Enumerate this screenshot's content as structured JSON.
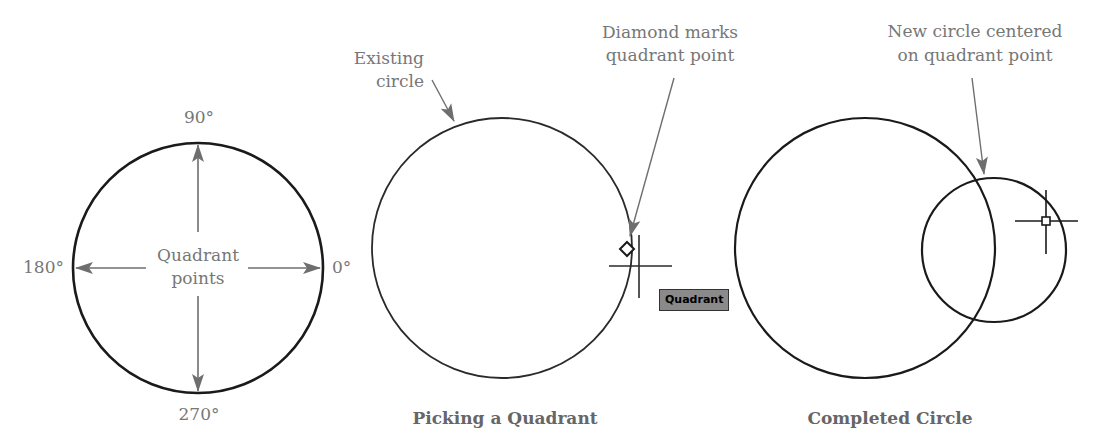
{
  "colors": {
    "circle_stroke": "#1a1a1a",
    "arrow": "#6e6e6e",
    "label_text": "#777777",
    "caption_text": "#666666",
    "tooltip_bg": "#8a8a8a"
  },
  "panel1": {
    "angle_top": "90°",
    "angle_left": "180°",
    "angle_right": "0°",
    "angle_bottom": "270°",
    "center_label_line1": "Quadrant",
    "center_label_line2": "points"
  },
  "panel2": {
    "callout_existing_line1": "Existing",
    "callout_existing_line2": "circle",
    "callout_diamond_line1": "Diamond marks",
    "callout_diamond_line2": "quadrant point",
    "tooltip": "Quadrant",
    "caption": "Picking a Quadrant"
  },
  "panel3": {
    "callout_line1": "New circle centered",
    "callout_line2": "on quadrant point",
    "caption": "Completed Circle"
  }
}
